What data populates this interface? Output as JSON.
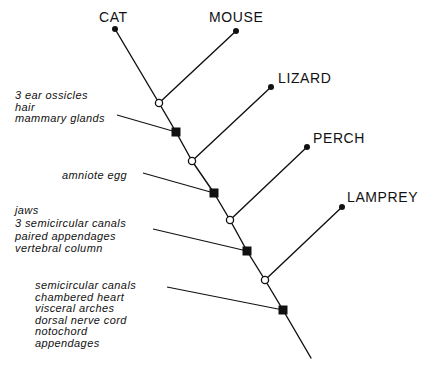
{
  "diagram": {
    "type": "cladogram",
    "taxa": [
      {
        "name": "CAT"
      },
      {
        "name": "MOUSE"
      },
      {
        "name": "LIZARD"
      },
      {
        "name": "PERCH"
      },
      {
        "name": "LAMPREY"
      }
    ],
    "characters": [
      {
        "traits": [
          "3 ear ossicles",
          "hair",
          "mammary glands"
        ]
      },
      {
        "traits": [
          "amniote egg"
        ]
      },
      {
        "traits": [
          "jaws",
          "3 semicircular canals",
          "paired appendages",
          "vertebral column"
        ]
      },
      {
        "traits": [
          "semicircular canals",
          "chambered heart",
          "visceral arches",
          "dorsal nerve cord",
          "notochord",
          "appendages"
        ]
      }
    ],
    "colors": {
      "line": "#111111",
      "background": "#ffffff"
    }
  }
}
